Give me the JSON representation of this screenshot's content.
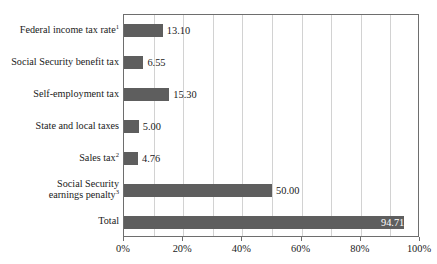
{
  "chart_data": {
    "type": "bar",
    "orientation": "horizontal",
    "title": "",
    "xlabel": "",
    "ylabel": "",
    "xlim": [
      0,
      100
    ],
    "grid": "vertical minor gridlines every 10%",
    "legend": "none",
    "bar_color": "#5e5e5e",
    "categories": [
      "Federal income tax rate",
      "Social Security benefit tax",
      "Self-employment tax",
      "State and local taxes",
      "Sales tax",
      "Social Security\nearnings penalty",
      "Total"
    ],
    "category_footnotes": [
      "1",
      "",
      "",
      "",
      "2",
      "3",
      ""
    ],
    "values": [
      13.1,
      6.55,
      15.3,
      5.0,
      4.76,
      50.0,
      94.71
    ],
    "value_labels": [
      "13.10",
      "6.55",
      "15.30",
      "5.00",
      "4.76",
      "50.00",
      "94.71"
    ],
    "value_label_placement": [
      "outside",
      "outside",
      "outside",
      "outside",
      "outside",
      "outside",
      "inside"
    ],
    "xticks": [
      0,
      20,
      40,
      60,
      80,
      100
    ],
    "xtick_labels": [
      "0%",
      "20%",
      "40%",
      "60%",
      "80%",
      "100%"
    ],
    "gridline_positions": [
      10,
      20,
      30,
      40,
      50,
      60,
      70,
      80,
      90
    ]
  }
}
